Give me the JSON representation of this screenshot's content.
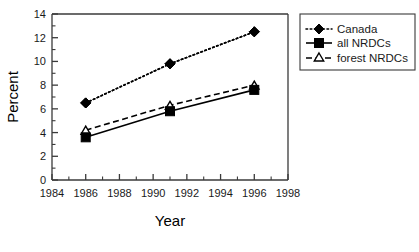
{
  "chart_data": {
    "type": "line",
    "title": "",
    "xlabel": "Year",
    "ylabel": "Percent",
    "xlim": [
      1984,
      1998
    ],
    "ylim": [
      0,
      14
    ],
    "x": [
      1986,
      1991,
      1996
    ],
    "xticks": [
      1984,
      1986,
      1988,
      1990,
      1992,
      1994,
      1996,
      1998
    ],
    "xtick_labels": [
      "1984",
      "1986",
      "1988",
      "1990",
      "1992",
      "1994",
      "1996",
      "1998"
    ],
    "xminor_ticks": [
      1985,
      1987,
      1989,
      1991,
      1993,
      1995,
      1997
    ],
    "yticks": [
      0,
      2,
      4,
      6,
      8,
      10,
      12,
      14
    ],
    "ytick_labels": [
      "0",
      "2",
      "4",
      "6",
      "8",
      "10",
      "12",
      "14"
    ],
    "yminor_ticks": [
      1,
      3,
      5,
      7,
      9,
      11,
      13
    ],
    "grid": false,
    "legend_position": "right",
    "series": [
      {
        "name": "Canada",
        "values": [
          6.5,
          9.8,
          12.5
        ],
        "marker": "filled-diamond",
        "line_style": "dotted",
        "color": "#000000"
      },
      {
        "name": "all NRDCs",
        "values": [
          3.6,
          5.8,
          7.6
        ],
        "marker": "filled-square",
        "line_style": "solid",
        "color": "#000000"
      },
      {
        "name": "forest NRDCs",
        "values": [
          4.2,
          6.3,
          8.0
        ],
        "marker": "open-triangle",
        "line_style": "dashed",
        "color": "#000000"
      }
    ]
  },
  "axes": {
    "y_title": "Percent",
    "x_title": "Year"
  },
  "legend": {
    "entries": [
      {
        "label": "Canada"
      },
      {
        "label": "all NRDCs"
      },
      {
        "label": "forest NRDCs"
      }
    ]
  }
}
